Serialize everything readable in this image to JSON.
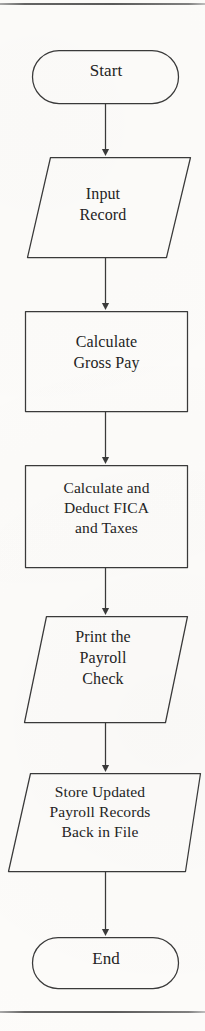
{
  "figure": {
    "type": "flowchart",
    "orientation": "vertical",
    "page_rules": {
      "top_rule": "horizontal-rule",
      "bottom_rule": "horizontal-rule"
    },
    "colors": {
      "stroke": "#3a3a3a",
      "text": "#242424",
      "background": "#fdfcfa"
    }
  },
  "nodes": [
    {
      "id": "start",
      "shape": "terminator",
      "label": "Start"
    },
    {
      "id": "input_record",
      "shape": "parallelogram",
      "label": "Input\nRecord"
    },
    {
      "id": "calculate_gross_pay",
      "shape": "rectangle",
      "label": "Calculate\nGross Pay"
    },
    {
      "id": "calculate_deduct_fica_taxes",
      "shape": "rectangle",
      "label": "Calculate and\nDeduct FICA\nand Taxes"
    },
    {
      "id": "print_payroll_check",
      "shape": "parallelogram",
      "label": "Print the\nPayroll\nCheck"
    },
    {
      "id": "store_updated_payroll",
      "shape": "parallelogram",
      "label": "Store Updated\nPayroll Records\nBack in File"
    },
    {
      "id": "end",
      "shape": "terminator",
      "label": "End"
    }
  ],
  "edges": [
    {
      "from": "start",
      "to": "input_record",
      "arrow": "down-arrow"
    },
    {
      "from": "input_record",
      "to": "calculate_gross_pay",
      "arrow": "down-arrow"
    },
    {
      "from": "calculate_gross_pay",
      "to": "calculate_deduct_fica_taxes",
      "arrow": "down-arrow"
    },
    {
      "from": "calculate_deduct_fica_taxes",
      "to": "print_payroll_check",
      "arrow": "down-arrow"
    },
    {
      "from": "print_payroll_check",
      "to": "store_updated_payroll",
      "arrow": "down-arrow"
    },
    {
      "from": "store_updated_payroll",
      "to": "end",
      "arrow": "down-arrow"
    }
  ],
  "caption_fragment": ""
}
